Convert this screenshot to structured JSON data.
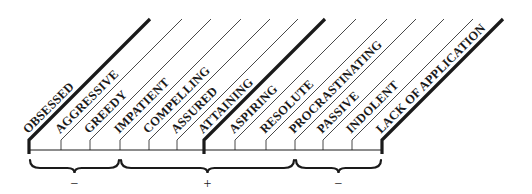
{
  "diagram": {
    "type": "spectrum-scale",
    "colors": {
      "ink": "#1a1a1a",
      "background": "#ffffff"
    },
    "baseline": {
      "y": 150,
      "x_start": 29,
      "x_end": 382
    },
    "terms": [
      {
        "label": "OBSESSED",
        "x": 29,
        "emphasis": "bold-boundary"
      },
      {
        "label": "AGGRESSIVE",
        "x": 61
      },
      {
        "label": "GREEDY",
        "x": 90
      },
      {
        "label": "IMPATIENT",
        "x": 120
      },
      {
        "label": "COMPELLING",
        "x": 149
      },
      {
        "label": "ASSURED",
        "x": 177
      },
      {
        "label": "ATTAINING",
        "x": 204,
        "emphasis": "bold-center"
      },
      {
        "label": "ASPIRING",
        "x": 235
      },
      {
        "label": "RESOLUTE",
        "x": 266
      },
      {
        "label": "PROCRASTINATING",
        "x": 295
      },
      {
        "label": "PASSIVE",
        "x": 323
      },
      {
        "label": "INDOLENT",
        "x": 352
      },
      {
        "label": "LACK OF APPLICATION",
        "x": 382,
        "emphasis": "bold-boundary"
      }
    ],
    "groups": [
      {
        "sign": "−",
        "from_x": 29,
        "to_x": 120,
        "meaning": "negative (excess)"
      },
      {
        "sign": "+",
        "from_x": 120,
        "to_x": 295,
        "meaning": "positive"
      },
      {
        "sign": "−",
        "from_x": 295,
        "to_x": 382,
        "meaning": "negative (deficiency)"
      }
    ]
  }
}
